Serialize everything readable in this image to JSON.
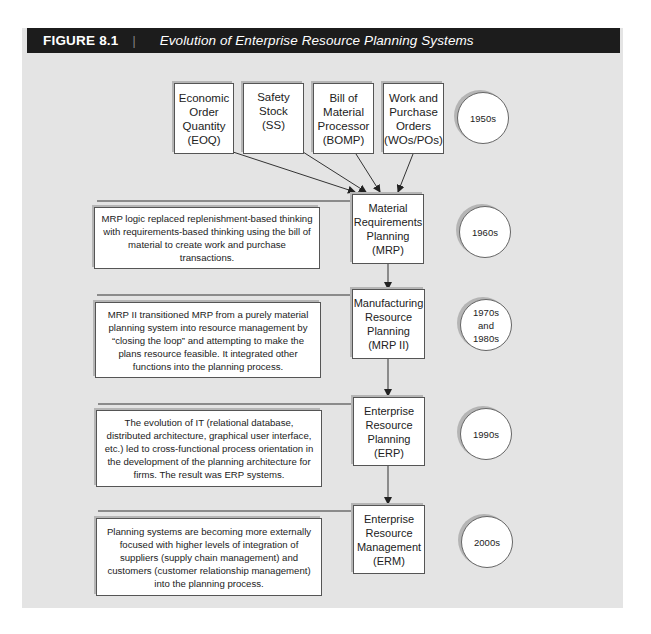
{
  "figure": {
    "label": "FIGURE 8.1",
    "separator": "|",
    "title": "Evolution of Enterprise Resource Planning Systems"
  },
  "inputs": [
    {
      "id": "eoq",
      "label": "Economic\nOrder\nQuantity\n(EOQ)"
    },
    {
      "id": "ss",
      "label": "Safety\nStock\n(SS)"
    },
    {
      "id": "bomp",
      "label": "Bill of\nMaterial\nProcessor\n(BOMP)"
    },
    {
      "id": "wopo",
      "label": "Work and\nPurchase\nOrders\n(WOs/POs)"
    }
  ],
  "stages": [
    {
      "id": "mrp",
      "label": "Material\nRequirements\nPlanning\n(MRP)",
      "era": "1960s",
      "description": "MRP logic replaced replenishment-based thinking with requirements-based thinking using the bill of material to create work and purchase transactions."
    },
    {
      "id": "mrp2",
      "label": "Manufacturing\nResource\nPlanning\n(MRP II)",
      "era": "1970s\nand\n1980s",
      "description": "MRP II transitioned MRP from a purely material planning system into resource management by “closing the loop” and attempting to make the plans resource feasible.  It integrated other functions into the planning process."
    },
    {
      "id": "erp",
      "label": "Enterprise\nResource\nPlanning\n(ERP)",
      "era": "1990s",
      "description": "The evolution of IT (relational database, distributed architecture, graphical user interface, etc.) led to cross-functional process orientation in the development of the planning architecture for firms.  The result was ERP systems."
    },
    {
      "id": "erm",
      "label": "Enterprise\nResource\nManagement\n(ERM)",
      "era": "2000s",
      "description": "Planning systems are becoming more externally focused with higher levels of integration of suppliers (supply chain management) and customers (customer relationship management) into the planning process."
    }
  ],
  "inputs_era": "1950s",
  "colors": {
    "panel_bg": "#e4e4e4",
    "titlebar_bg": "#1c1c1c",
    "box_bg": "#ffffff",
    "line": "#333333"
  }
}
